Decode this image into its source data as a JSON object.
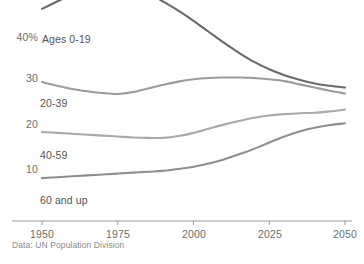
{
  "chart_data": {
    "type": "line",
    "title": "",
    "subtitle": "",
    "xlabel": "",
    "ylabel": "",
    "xlim": [
      1950,
      2050
    ],
    "ylim": [
      0,
      52
    ],
    "grid": false,
    "legend_position": "inline-labels",
    "source": "Data: UN Population Division",
    "x_ticks": [
      1950,
      1975,
      2000,
      2025,
      2050
    ],
    "x_tick_labels": [
      "1950",
      "1975",
      "2000",
      "2025",
      "2050"
    ],
    "y_ticks": [
      10,
      20,
      30,
      40
    ],
    "y_tick_labels": [
      "10",
      "20",
      "30",
      "40%"
    ],
    "x": [
      1950,
      1955,
      1960,
      1965,
      1970,
      1975,
      1980,
      1985,
      1990,
      1995,
      2000,
      2005,
      2010,
      2015,
      2020,
      2025,
      2030,
      2035,
      2040,
      2045,
      2050
    ],
    "series": [
      {
        "name": "Ages 0-19",
        "label": "Ages 0-19",
        "color": "#6a6a6a",
        "values": [
          45.0,
          46.6,
          48.2,
          49.7,
          50.9,
          51.2,
          50.1,
          48.5,
          46.6,
          44.6,
          42.4,
          40.0,
          37.6,
          35.4,
          33.4,
          31.8,
          30.5,
          29.5,
          28.7,
          28.2,
          27.8
        ]
      },
      {
        "name": "20-39",
        "label": "20-39",
        "color": "#9c9c9c",
        "values": [
          29.0,
          28.2,
          27.5,
          27.0,
          26.6,
          26.4,
          26.8,
          27.6,
          28.4,
          29.1,
          29.6,
          29.9,
          30.0,
          30.0,
          29.9,
          29.6,
          29.2,
          28.5,
          27.8,
          27.1,
          26.5
        ]
      },
      {
        "name": "40-59",
        "label": "40-59",
        "color": "#a9a9a9",
        "values": [
          18.1,
          17.9,
          17.7,
          17.5,
          17.3,
          17.1,
          16.9,
          16.8,
          16.8,
          17.2,
          17.9,
          18.8,
          19.7,
          20.5,
          21.2,
          21.7,
          22.0,
          22.2,
          22.3,
          22.6,
          23.0
        ]
      },
      {
        "name": "60 and up",
        "label": "60 and up",
        "color": "#8f8f8f",
        "values": [
          8.0,
          8.2,
          8.4,
          8.6,
          8.8,
          9.0,
          9.2,
          9.4,
          9.6,
          10.0,
          10.5,
          11.2,
          12.1,
          13.2,
          14.4,
          15.8,
          17.1,
          18.2,
          19.0,
          19.6,
          20.0
        ]
      }
    ],
    "series_label_positions": [
      {
        "name": "Ages 0-19",
        "x_px": 42,
        "y_px": 39
      },
      {
        "name": "20-39",
        "x_px": 40,
        "y_px": 103
      },
      {
        "name": "40-59",
        "x_px": 40,
        "y_px": 155
      },
      {
        "name": "60 and up",
        "x_px": 40,
        "y_px": 200
      }
    ]
  }
}
